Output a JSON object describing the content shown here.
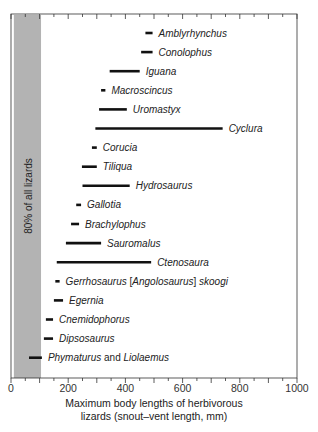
{
  "chart_data": {
    "type": "range-bar",
    "title": "",
    "xlabel": "Maximum body lengths of herbivorous lizards (snout–vent length, mm)",
    "xlabel_lines": [
      "Maximum body lengths of herbivorous",
      "lizards (snout–vent length, mm)"
    ],
    "ylabel": "",
    "xlim": [
      0,
      1000
    ],
    "x_ticks": [
      0,
      200,
      400,
      600,
      800,
      1000
    ],
    "x_minor_ticks": [
      50,
      100,
      150,
      250,
      300,
      350,
      450,
      500,
      550,
      650,
      700,
      750,
      850,
      900,
      950
    ],
    "grid": false,
    "shaded_region": {
      "label": "80% of all lizards",
      "from": 10,
      "to": 105,
      "color": "#b3b3b3"
    },
    "series": [
      {
        "name": "Amblyrhynchus",
        "min": 470,
        "max": 495
      },
      {
        "name": "Conolophus",
        "min": 455,
        "max": 495
      },
      {
        "name": "Iguana",
        "min": 345,
        "max": 450
      },
      {
        "name": "Macroscincus",
        "min": 315,
        "max": 330
      },
      {
        "name": "Uromastyx",
        "min": 308,
        "max": 405
      },
      {
        "name": "Cyclura",
        "min": 295,
        "max": 740
      },
      {
        "name": "Corucia",
        "min": 283,
        "max": 300
      },
      {
        "name": "Tiliqua",
        "min": 248,
        "max": 300
      },
      {
        "name": "Hydrosaurus",
        "min": 250,
        "max": 415
      },
      {
        "name": "Gallotia",
        "min": 228,
        "max": 245
      },
      {
        "name": "Brachylophus",
        "min": 210,
        "max": 238
      },
      {
        "name": "Sauromalus",
        "min": 192,
        "max": 315
      },
      {
        "name": "Ctenosaura",
        "min": 160,
        "max": 490
      },
      {
        "name": "Gerrhosaurus [Angolosaurus] skoogi",
        "min": 155,
        "max": 170
      },
      {
        "name": "Egernia",
        "min": 150,
        "max": 182
      },
      {
        "name": "Cnemidophorus",
        "min": 122,
        "max": 147
      },
      {
        "name": "Dipsosaurus",
        "min": 115,
        "max": 147
      },
      {
        "name": "Phymaturus and Liolaemus",
        "min": 63,
        "max": 108
      }
    ]
  },
  "labels": {
    "band": "80% of all lizards",
    "taxa": [
      [
        {
          "t": "Amblyrhynchus",
          "i": true
        }
      ],
      [
        {
          "t": "Conolophus",
          "i": true
        }
      ],
      [
        {
          "t": "Iguana",
          "i": true
        }
      ],
      [
        {
          "t": "Macroscincus",
          "i": true
        }
      ],
      [
        {
          "t": "Uromastyx",
          "i": true
        }
      ],
      [
        {
          "t": "Cyclura",
          "i": true
        }
      ],
      [
        {
          "t": "Corucia",
          "i": true
        }
      ],
      [
        {
          "t": "Tiliqua",
          "i": true
        }
      ],
      [
        {
          "t": "Hydrosaurus",
          "i": true
        }
      ],
      [
        {
          "t": "Gallotia",
          "i": true
        }
      ],
      [
        {
          "t": "Brachylophus",
          "i": true
        }
      ],
      [
        {
          "t": "Sauromalus",
          "i": true
        }
      ],
      [
        {
          "t": "Ctenosaura",
          "i": true
        }
      ],
      [
        {
          "t": "Gerrhosaurus ",
          "i": true
        },
        {
          "t": "[",
          "i": false
        },
        {
          "t": "Angolosaurus",
          "i": true
        },
        {
          "t": "] ",
          "i": false
        },
        {
          "t": "skoogi",
          "i": true
        }
      ],
      [
        {
          "t": "Egernia",
          "i": true
        }
      ],
      [
        {
          "t": "Cnemidophorus",
          "i": true
        }
      ],
      [
        {
          "t": "Dipsosaurus",
          "i": true
        }
      ],
      [
        {
          "t": "Phymaturus",
          "i": true
        },
        {
          "t": " and ",
          "i": false
        },
        {
          "t": "Liolaemus",
          "i": true
        }
      ]
    ]
  },
  "colors": {
    "bar": "#111111",
    "band": "#b3b3b3",
    "frame": "#333333"
  }
}
